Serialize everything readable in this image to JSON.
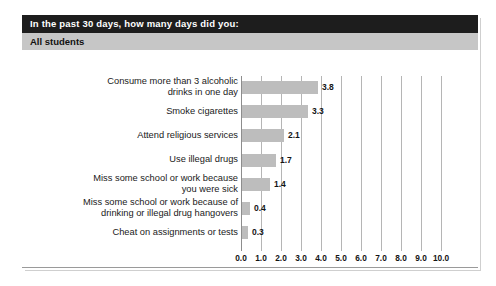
{
  "panel": {
    "title_prefix": "In the past 30 days, how many ",
    "title_emphasis": "days",
    "title_suffix": " did you:",
    "title_full": "In the past 30 days, how many days did you:",
    "subtitle": "All students"
  },
  "colors": {
    "title_bar_background": "#1d1d1d",
    "title_text": "#ffffff",
    "subtitle_bar_background": "#c6c6c6",
    "subtitle_text": "#111111",
    "bar_fill": "#bdbdbd",
    "gridline": "#b5b5b5",
    "axis_line": "#8d8d8d",
    "plot_background": "#ffffff",
    "panel_border": "#9a9a9a"
  },
  "chart_data": {
    "type": "bar",
    "orientation": "horizontal",
    "title": "In the past 30 days, how many days did you:",
    "subtitle": "All students",
    "xlabel": "",
    "ylabel": "",
    "xlim": [
      0.0,
      10.0
    ],
    "grid": true,
    "legend": "none",
    "xticks": [
      "0.0",
      "1.0",
      "2.0",
      "3.0",
      "4.0",
      "5.0",
      "6.0",
      "7.0",
      "8.0",
      "9.0",
      "10.0"
    ],
    "xtick_values": [
      0.0,
      1.0,
      2.0,
      3.0,
      4.0,
      5.0,
      6.0,
      7.0,
      8.0,
      9.0,
      10.0
    ],
    "categories": [
      "Consume more than 3 alcoholic\ndrinks in one day",
      "Smoke cigarettes",
      "Attend religious services",
      "Use illegal drugs",
      "Miss some school or work because\nyou were sick",
      "Miss some school or work because of\ndrinking or illegal drug hangovers",
      "Cheat on assignments or tests"
    ],
    "values": [
      3.8,
      3.3,
      2.1,
      1.7,
      1.4,
      0.4,
      0.3
    ],
    "value_labels": [
      "3.8",
      "3.3",
      "2.1",
      "1.7",
      "1.4",
      "0.4",
      "0.3"
    ]
  }
}
